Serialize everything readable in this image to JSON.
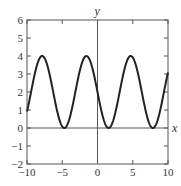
{
  "chart_data": {
    "type": "line",
    "title": "",
    "xlabel": "x",
    "ylabel": "y",
    "xlim": [
      -10,
      10
    ],
    "ylim": [
      -2,
      6
    ],
    "x_ticks": [
      -10,
      -5,
      0,
      5,
      10
    ],
    "y_ticks": [
      -2,
      -1,
      0,
      1,
      2,
      3,
      4,
      5,
      6
    ],
    "x_tick_labels": [
      "-10",
      "-5",
      "0",
      "5",
      "10"
    ],
    "y_tick_labels": [
      "-2",
      "-1",
      "0",
      "1",
      "2",
      "3",
      "4",
      "5",
      "6"
    ],
    "grid": false,
    "legend": null,
    "series": [
      {
        "name": "y = 2 - 2 sin x",
        "expression": "2 - 2*sin(x)",
        "x": [
          -10,
          -9,
          -8,
          -7.85,
          -7,
          -6,
          -5,
          -4.71,
          -4,
          -3,
          -2,
          -1.57,
          -1,
          0,
          1,
          1.57,
          2,
          3,
          4,
          4.71,
          5,
          6,
          7,
          7.85,
          8,
          9,
          10
        ],
        "values": [
          0.91,
          2.82,
          3.98,
          4.0,
          3.31,
          1.44,
          0.08,
          0.0,
          0.49,
          2.28,
          3.82,
          4.0,
          3.68,
          2.0,
          0.32,
          0.0,
          0.18,
          1.72,
          3.51,
          4.0,
          3.92,
          2.56,
          0.69,
          0.0,
          0.02,
          1.18,
          3.09
        ],
        "color": "#222222"
      }
    ]
  },
  "labels": {
    "x_axis": "x",
    "y_axis": "y"
  },
  "colors": {
    "curve": "#222222",
    "axes": "#555555",
    "frame": "#555555"
  }
}
